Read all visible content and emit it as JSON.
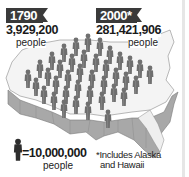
{
  "infographic": {
    "left_stat": {
      "year": "1790",
      "population": "3,929,200",
      "unit": "people"
    },
    "right_stat": {
      "year": "2000*",
      "population": "281,421,906",
      "unit": "people"
    },
    "legend": {
      "icon": "person-icon",
      "value": "=10,000,000",
      "unit": "people"
    },
    "footnote": {
      "line1": "*Includes Alaska",
      "line2": "and Hawaii"
    },
    "colors": {
      "badge": "#3a3a3a",
      "figure": "#7a7a7a",
      "map_fill": "#f4f4f4",
      "map_edge": "#9a9a9a"
    }
  }
}
